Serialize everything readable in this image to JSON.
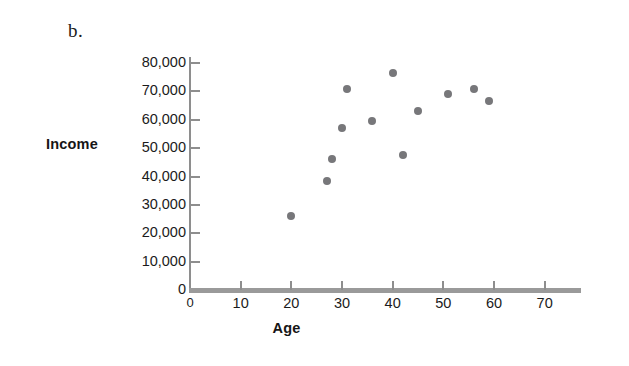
{
  "panel": {
    "label": "b."
  },
  "axis_titles": {
    "y": "Income",
    "x": "Age"
  },
  "chart_data": {
    "type": "scatter",
    "title": "",
    "subtitle": "",
    "panel_label": "b.",
    "xlabel": "Age",
    "ylabel": "Income",
    "xlim": [
      0,
      75
    ],
    "ylim": [
      0,
      80000
    ],
    "xticks": [
      0,
      10,
      20,
      30,
      40,
      50,
      60,
      70
    ],
    "xtick_labels": [
      "0",
      "10",
      "20",
      "30",
      "40",
      "50",
      "60",
      "70"
    ],
    "yticks": [
      0,
      10000,
      20000,
      30000,
      40000,
      50000,
      60000,
      70000,
      80000
    ],
    "ytick_labels": [
      "0",
      "10,000",
      "20,000",
      "30,000",
      "40,000",
      "50,000",
      "60,000",
      "70,000",
      "80,000"
    ],
    "grid": false,
    "legend": null,
    "marker_color": "#77777a",
    "axis_color": "#8e8e8e",
    "series": [
      {
        "name": "Income by age",
        "points": [
          {
            "x": 20,
            "y": 26000
          },
          {
            "x": 27,
            "y": 38500
          },
          {
            "x": 28,
            "y": 46000
          },
          {
            "x": 30,
            "y": 57000
          },
          {
            "x": 31,
            "y": 71000
          },
          {
            "x": 36,
            "y": 59500
          },
          {
            "x": 40,
            "y": 76500
          },
          {
            "x": 42,
            "y": 47500
          },
          {
            "x": 45,
            "y": 63000
          },
          {
            "x": 51,
            "y": 69000
          },
          {
            "x": 56,
            "y": 71000
          },
          {
            "x": 59,
            "y": 66500
          }
        ]
      }
    ]
  }
}
